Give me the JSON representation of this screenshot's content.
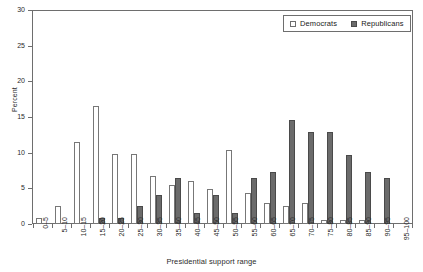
{
  "chart_data": {
    "type": "bar",
    "title": "",
    "xlabel": "Presidential support range",
    "ylabel": "Percent",
    "ylim": [
      0,
      30
    ],
    "yticks": [
      0,
      5,
      10,
      15,
      20,
      25,
      30
    ],
    "grid": false,
    "legend_position": "top-right-inside",
    "categories": [
      "0–5",
      "5–10",
      "10–15",
      "15–20",
      "20–25",
      "25–30",
      "30–35",
      "35–40",
      "40–45",
      "45–50",
      "50–55",
      "55–60",
      "60–65",
      "65–70",
      "70–75",
      "75–80",
      "80–85",
      "85–90",
      "90–95",
      "95–100"
    ],
    "series": [
      {
        "name": "Democrats",
        "color": "#ffffff",
        "values": [
          0.8,
          2.5,
          11.6,
          16.6,
          9.8,
          9.8,
          6.7,
          5.5,
          6.1,
          4.9,
          10.4,
          4.3,
          3.0,
          2.5,
          3.0,
          0.6,
          0.6,
          0.6,
          0.0,
          0.0
        ]
      },
      {
        "name": "Republicans",
        "color": "#6b6b6b",
        "values": [
          0.0,
          0.0,
          0.0,
          0.8,
          0.8,
          2.5,
          4.1,
          6.5,
          1.6,
          4.1,
          1.6,
          6.5,
          7.3,
          14.6,
          13.0,
          13.0,
          9.7,
          7.3,
          6.5,
          0.0
        ]
      }
    ]
  },
  "legend": {
    "items": [
      {
        "label": "Democrats",
        "swatch": "hollow-square-icon"
      },
      {
        "label": "Republicans",
        "swatch": "filled-square-icon"
      }
    ]
  }
}
